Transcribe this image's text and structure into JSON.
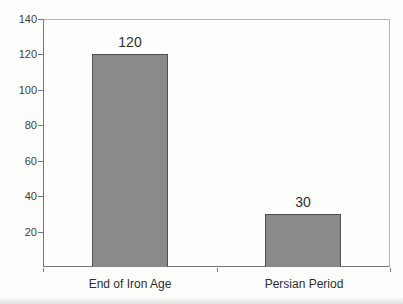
{
  "chart_data": {
    "type": "bar",
    "categories": [
      "End of Iron Age",
      "Persian Period"
    ],
    "values": [
      120,
      30
    ],
    "bar_labels": [
      "120",
      "30"
    ],
    "title": "",
    "xlabel": "",
    "ylabel": "",
    "ylim": [
      0,
      140
    ],
    "yticks": [
      20,
      40,
      60,
      80,
      100,
      120,
      140
    ],
    "grid": false,
    "legend": "none",
    "colors": {
      "bar_fill": "#8a8a8a",
      "bar_border": "#4f4f4f",
      "axis_line": "#767676",
      "plot_border": "#b5b5b5",
      "tick_text": "#3d3d3d",
      "label_text": "#2e2e2e"
    }
  }
}
